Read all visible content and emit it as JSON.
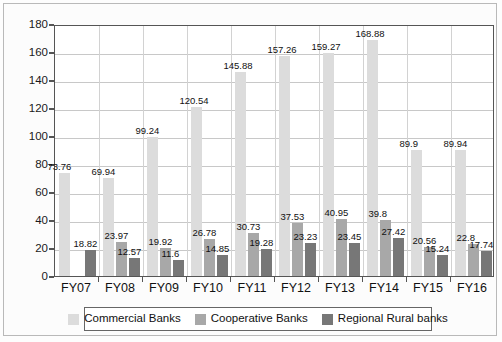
{
  "chart_data": {
    "type": "bar",
    "title": "",
    "subtitle": "",
    "xlabel": "",
    "ylabel": "",
    "ylim": [
      0,
      180
    ],
    "ytick_step": 20,
    "yticks": [
      0,
      20,
      40,
      60,
      80,
      100,
      120,
      140,
      160,
      180
    ],
    "grid": true,
    "legend_position": "bottom",
    "categories": [
      "FY07",
      "FY08",
      "FY09",
      "FY10",
      "FY11",
      "FY12",
      "FY13",
      "FY14",
      "FY15",
      "FY16"
    ],
    "series": [
      {
        "name": "Commercial Banks",
        "color": "#dcdcdc",
        "values": [
          73.76,
          69.94,
          99.24,
          120.54,
          145.88,
          157.26,
          159.27,
          168.88,
          89.9,
          89.94
        ]
      },
      {
        "name": "Cooperative Banks",
        "color": "#a8a8a8",
        "values": [
          null,
          23.97,
          19.92,
          26.78,
          30.73,
          37.53,
          40.95,
          39.8,
          20.56,
          22.8
        ]
      },
      {
        "name": "Regional Rural banks",
        "color": "#777777",
        "values": [
          18.82,
          12.57,
          11.6,
          14.85,
          19.28,
          23.23,
          23.45,
          27.42,
          15.24,
          17.74
        ]
      }
    ],
    "data_labels": {
      "FY07": [
        "73.76",
        "",
        "18.82"
      ],
      "FY08": [
        "69.94",
        "23.97",
        "12.57"
      ],
      "FY09": [
        "99.24",
        "19.92",
        "11.6"
      ],
      "FY10": [
        "120.54",
        "26.78",
        "14.85"
      ],
      "FY11": [
        "145.88",
        "30.73",
        "19.28"
      ],
      "FY12": [
        "157.26",
        "37.53",
        "23.23"
      ],
      "FY13": [
        "159.27",
        "40.95",
        "23.45"
      ],
      "FY14": [
        "168.88",
        "39.8",
        "27.42"
      ],
      "FY15": [
        "89.9",
        "20.56",
        "15.24"
      ],
      "FY16": [
        "89.94",
        "22.8",
        "17.74"
      ]
    }
  }
}
